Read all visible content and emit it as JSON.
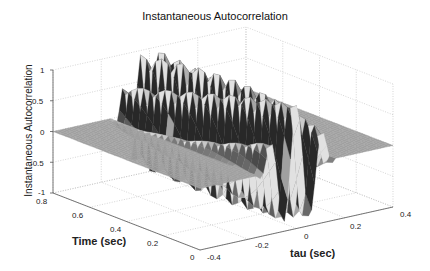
{
  "chart_data": {
    "type": "surface3d",
    "title": "Instantaneous Autocorrelation",
    "xlabel": "tau (sec)",
    "ylabel": "Time (sec)",
    "zlabel": "Instantaneous Autocorrelation",
    "xlim": [
      -0.4,
      0.4
    ],
    "ylim": [
      0,
      0.8
    ],
    "zlim": [
      -1,
      1
    ],
    "x_ticks": [
      "-0.4",
      "-0.2",
      "0",
      "0.2",
      "0.4"
    ],
    "y_ticks": [
      "0",
      "0.2",
      "0.4",
      "0.6",
      "0.8"
    ],
    "z_ticks": [
      "-1",
      "-0.5",
      "0",
      "0.5",
      "1"
    ],
    "grid": true,
    "colormap": "gray"
  }
}
